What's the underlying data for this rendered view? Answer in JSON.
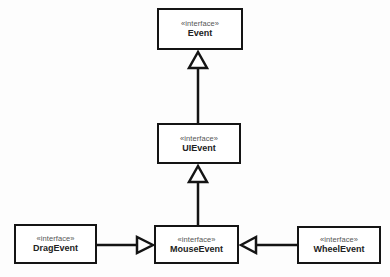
{
  "diagram": {
    "type": "uml-class-inheritance",
    "colors": {
      "border": "#141414",
      "stereotype_text": "#555555",
      "name_text": "#222222",
      "background": "#ffffff"
    },
    "nodes": [
      {
        "id": "event",
        "stereotype": "«interface»",
        "name": "Event",
        "x": 157,
        "y": 8,
        "w": 86,
        "h": 42
      },
      {
        "id": "uievent",
        "stereotype": "«interface»",
        "name": "UIEvent",
        "x": 157,
        "y": 123,
        "w": 84,
        "h": 41
      },
      {
        "id": "mouseevent",
        "stereotype": "«interface»",
        "name": "MouseEvent",
        "x": 154,
        "y": 225,
        "w": 85,
        "h": 39
      },
      {
        "id": "dragevent",
        "stereotype": "«interface»",
        "name": "DragEvent",
        "x": 14,
        "y": 224,
        "w": 83,
        "h": 40
      },
      {
        "id": "wheelevent",
        "stereotype": "«interface»",
        "name": "WheelEvent",
        "x": 297,
        "y": 226,
        "w": 84,
        "h": 38
      }
    ],
    "edges": [
      {
        "from": "UIEvent",
        "to": "Event",
        "kind": "generalization"
      },
      {
        "from": "MouseEvent",
        "to": "UIEvent",
        "kind": "generalization"
      },
      {
        "from": "DragEvent",
        "to": "MouseEvent",
        "kind": "generalization"
      },
      {
        "from": "WheelEvent",
        "to": "MouseEvent",
        "kind": "generalization"
      }
    ]
  }
}
